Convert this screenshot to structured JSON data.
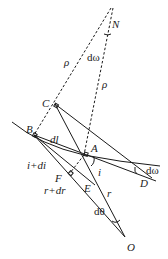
{
  "diagram": {
    "points": {
      "N": {
        "label": "N",
        "x": 111,
        "y": 10
      },
      "C": {
        "label": "C",
        "x": 55,
        "y": 104
      },
      "B": {
        "label": "B",
        "x": 34,
        "y": 135
      },
      "A": {
        "label": "A",
        "x": 84,
        "y": 155
      },
      "D": {
        "label": "D",
        "x": 152,
        "y": 178
      },
      "E": {
        "label": "E",
        "x": 87,
        "y": 186
      },
      "F": {
        "label": "F",
        "x": 70,
        "y": 173
      },
      "O": {
        "label": "O",
        "x": 125,
        "y": 237
      }
    },
    "annotations": {
      "rho_left": "ρ",
      "rho_right": "ρ",
      "domega_top": "dω",
      "domega_right": "dω",
      "dl": "dl",
      "i_plus_di": "i+di",
      "r_plus_dr": "r+dr",
      "i": "i",
      "r": "r",
      "dtheta": "dθ"
    }
  }
}
